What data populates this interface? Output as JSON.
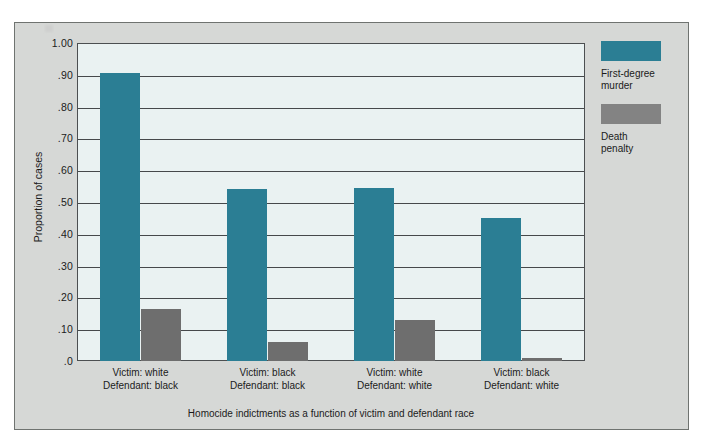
{
  "chart_data": {
    "type": "bar",
    "title": "",
    "subtitle": "",
    "xlabel": "Homocide indictments as a function of victim and defendant race",
    "ylabel": "Proportion of cases",
    "ylim": [
      0,
      1.0
    ],
    "grid": true,
    "legend_position": "right",
    "categories": [
      "Victim: white / Defendant: black",
      "Victim: black / Defendant: black",
      "Victim: white / Defendant: white",
      "Victim: black / Defendant: white"
    ],
    "category_lines": [
      [
        "Victim: white",
        "Defendant:  black"
      ],
      [
        "Victim: black",
        "Defendant:  black"
      ],
      [
        "Victim: white",
        "Defendant:  white"
      ],
      [
        "Victim: black",
        "Defendant:  white"
      ]
    ],
    "series": [
      {
        "name": "First-degree murder",
        "name_lines": [
          "First-degree",
          "murder"
        ],
        "color": "#2b7e94",
        "values": [
          0.905,
          0.54,
          0.545,
          0.45
        ]
      },
      {
        "name": "Death penalty",
        "name_lines": [
          "Death",
          "penalty"
        ],
        "color": "#6e6e6e",
        "values": [
          0.165,
          0.06,
          0.13,
          0.01
        ]
      }
    ],
    "ytick_labels": [
      "1.00",
      ".90",
      ".80",
      ".70",
      ".60",
      ".50",
      ".40",
      ".30",
      ".20",
      ".10",
      ".0"
    ],
    "ytick_values": [
      1.0,
      0.9,
      0.8,
      0.7,
      0.6,
      0.5,
      0.4,
      0.3,
      0.2,
      0.1,
      0.0
    ]
  },
  "colors": {
    "first_degree_murder": "#2b7e94",
    "death_penalty": "#6e6e6e",
    "legend_death_penalty_swatch": "#838383",
    "plot_background": "#eaf2f2",
    "panel_background": "#d6d8d6",
    "gridline": "#46494b",
    "text": "#1b1b1b"
  }
}
